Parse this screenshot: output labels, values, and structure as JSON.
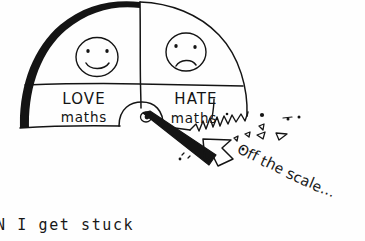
{
  "figure": {
    "kind": "hand-drawn-cartoon-gauge",
    "background_color": "#fefefe",
    "ink_color": "#141414"
  },
  "gauge": {
    "name": "maths feeling meter",
    "left_panel": {
      "line1": "LOVE",
      "line2": "maths",
      "face": "smiley-face",
      "arc_fill": "solid-black"
    },
    "right_panel": {
      "line1": "HATE",
      "line2": "maths",
      "face": "sad-face",
      "arc_fill": "outline"
    },
    "needle": {
      "label": "needle",
      "direction": "down-right, past the edge",
      "pivot_label": "needle-pivot-hub"
    },
    "broken_edge": {
      "label": "jagged-torn-edge",
      "debris_count": 11
    }
  },
  "annotations": {
    "scale_note": "Off the scale...",
    "bottom_caption": "N I get stuck"
  },
  "colors": {
    "ink": "#141414",
    "paper": "#fefefe"
  }
}
